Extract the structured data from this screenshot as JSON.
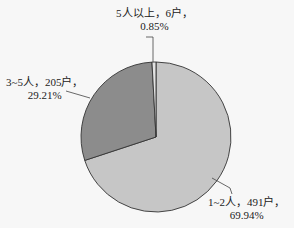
{
  "chart_data": {
    "type": "pie",
    "title": "",
    "categories": [
      "1~2人",
      "3~5人",
      "5人以上"
    ],
    "values": [
      491,
      205,
      6
    ],
    "unit": "户",
    "percentages": [
      69.94,
      29.21,
      0.85
    ],
    "colors": [
      "#c6c6c6",
      "#8c8c8c",
      "#e2e2e2"
    ],
    "start_angle_deg": 0,
    "direction": "clockwise",
    "legend": "none",
    "data_labels": [
      {
        "line1": "1~2人，491户，",
        "line2": "69.94%"
      },
      {
        "line1": "3~5人，205户，",
        "line2": "29.21%"
      },
      {
        "line1": "5人以上，6户，",
        "line2": "0.85%"
      }
    ]
  },
  "labels": {
    "slice1_line1": "1~2人，491户，",
    "slice1_line2": "69.94%",
    "slice2_line1": "3~5人，205户，",
    "slice2_line2": "29.21%",
    "slice3_line1": "5人以上，6户，",
    "slice3_line2": "0.85%"
  }
}
